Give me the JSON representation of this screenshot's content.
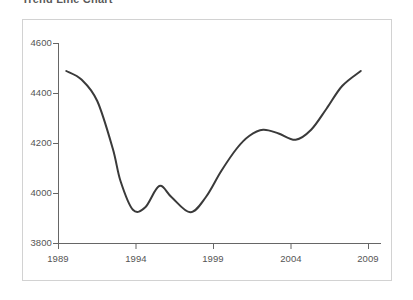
{
  "chart_data": {
    "type": "line",
    "title": "Trend Line Chart",
    "xlabel": "",
    "ylabel": "",
    "xlim": [
      1989,
      2010
    ],
    "ylim": [
      3800,
      4600
    ],
    "xticks": [
      1989,
      1994,
      1999,
      2004,
      2009
    ],
    "yticks": [
      3800,
      4000,
      4200,
      4400,
      4600
    ],
    "xtick_labels": [
      "1989",
      "1994",
      "1999",
      "2004",
      "2009"
    ],
    "ytick_labels": [
      "3800",
      "4000",
      "4200",
      "4400",
      "4600"
    ],
    "grid": false,
    "legend": null,
    "line_color": "#3a3a3a",
    "line_width": 2,
    "frame_color": "#d2d2d2",
    "background": "#ffffff",
    "series": [
      {
        "name": "value",
        "x": [
          1989.5,
          1990.5,
          1991.5,
          1992.5,
          1993.0,
          1993.8,
          1994.6,
          1995.5,
          1996.3,
          1997.5,
          1998.5,
          1999.5,
          2000.5,
          2001.3,
          2002.2,
          2003.2,
          2004.3,
          2005.3,
          2006.3,
          2007.3,
          2008.5
        ],
        "y": [
          4490,
          4455,
          4370,
          4180,
          4050,
          3935,
          3945,
          4030,
          3985,
          3925,
          3985,
          4090,
          4180,
          4230,
          4255,
          4240,
          4215,
          4255,
          4340,
          4430,
          4490
        ]
      }
    ],
    "annotations": [
      {
        "label": "start",
        "x": 1989.5,
        "y": 4490
      },
      {
        "label": "first-trough",
        "x": 1993.8,
        "y": 3935
      },
      {
        "label": "local-peak",
        "x": 1995.5,
        "y": 4030
      },
      {
        "label": "second-trough",
        "x": 1997.5,
        "y": 3925
      },
      {
        "label": "plateau-peak",
        "x": 2002.2,
        "y": 4255
      },
      {
        "label": "plateau-dip",
        "x": 2004.3,
        "y": 4215
      },
      {
        "label": "end",
        "x": 2008.5,
        "y": 4490
      }
    ]
  }
}
